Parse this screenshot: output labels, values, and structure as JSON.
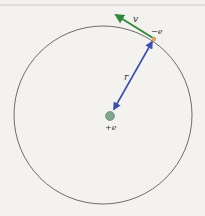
{
  "diagram": {
    "type": "bohr-atom-orbit",
    "labels": {
      "velocity": "v",
      "electron": "−e",
      "radius": "r",
      "nucleus": "+e"
    },
    "colors": {
      "background": "#f3f2ee",
      "orbit": "#4a4a4a",
      "velocity_arrow": "#2e8b3e",
      "radius_arrow": "#3b4fb0",
      "electron": "#e0a060",
      "nucleus": "#7fa58f",
      "top_rule": "#c8c8c4"
    },
    "geometry": {
      "orbit_center": [
        103,
        115
      ],
      "orbit_radius": 92,
      "nucleus_center": [
        110,
        116
      ],
      "nucleus_radius": 4.5,
      "electron_center": [
        154,
        39
      ],
      "velocity_tip": [
        113,
        14
      ]
    }
  }
}
